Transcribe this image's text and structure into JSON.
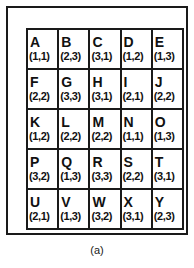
{
  "figure": {
    "caption": "(a)",
    "border_color": "#1a1a1a",
    "background_color": "#ffffff",
    "text_color": "#111111"
  },
  "grid": {
    "rows": 5,
    "columns": 5,
    "cells": [
      [
        {
          "letter": "A",
          "coord": "(1,1)"
        },
        {
          "letter": "B",
          "coord": "(2,3)"
        },
        {
          "letter": "C",
          "coord": "(3,1)"
        },
        {
          "letter": "D",
          "coord": "(1,2)"
        },
        {
          "letter": "E",
          "coord": "(1,3)"
        }
      ],
      [
        {
          "letter": "F",
          "coord": "(2,2)"
        },
        {
          "letter": "G",
          "coord": "(3,3)"
        },
        {
          "letter": "H",
          "coord": "(3,1)"
        },
        {
          "letter": "I",
          "coord": "(2,1)"
        },
        {
          "letter": "J",
          "coord": "(2,2)"
        }
      ],
      [
        {
          "letter": "K",
          "coord": "(1,2)"
        },
        {
          "letter": "L",
          "coord": "(2,2)"
        },
        {
          "letter": "M",
          "coord": "(2,2)"
        },
        {
          "letter": "N",
          "coord": "(1,1)"
        },
        {
          "letter": "O",
          "coord": "(1,3)"
        }
      ],
      [
        {
          "letter": "P",
          "coord": "(3,2)"
        },
        {
          "letter": "Q",
          "coord": "(1,3)"
        },
        {
          "letter": "R",
          "coord": "(3,3)"
        },
        {
          "letter": "S",
          "coord": "(2,2)"
        },
        {
          "letter": "T",
          "coord": "(3,1)"
        }
      ],
      [
        {
          "letter": "U",
          "coord": "(2,1)"
        },
        {
          "letter": "V",
          "coord": "(1,3)"
        },
        {
          "letter": "W",
          "coord": "(3,2)"
        },
        {
          "letter": "X",
          "coord": "(3,1)"
        },
        {
          "letter": "Y",
          "coord": "(2,3)"
        }
      ]
    ]
  }
}
